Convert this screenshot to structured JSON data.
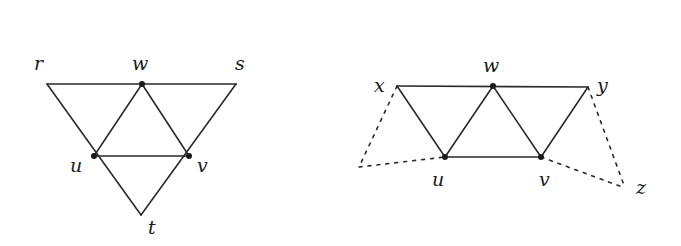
{
  "diagrams": [
    {
      "name": "left-graph",
      "vertices": [
        {
          "id": "r",
          "label": "r",
          "x": 47,
          "y": 84,
          "dot": false,
          "lx": 34,
          "ly": 70
        },
        {
          "id": "w",
          "label": "w",
          "x": 142,
          "y": 84,
          "dot": true,
          "lx": 132,
          "ly": 70
        },
        {
          "id": "s",
          "label": "s",
          "x": 236,
          "y": 84,
          "dot": false,
          "lx": 235,
          "ly": 70
        },
        {
          "id": "u",
          "label": "u",
          "x": 94,
          "y": 156,
          "dot": true,
          "lx": 70,
          "ly": 172
        },
        {
          "id": "v",
          "label": "v",
          "x": 189,
          "y": 156,
          "dot": true,
          "lx": 197,
          "ly": 172
        },
        {
          "id": "t",
          "label": "t",
          "x": 141,
          "y": 215,
          "dot": false,
          "lx": 148,
          "ly": 234
        }
      ],
      "edges": [
        [
          "r",
          "s"
        ],
        [
          "r",
          "t"
        ],
        [
          "s",
          "t"
        ],
        [
          "w",
          "u"
        ],
        [
          "w",
          "v"
        ],
        [
          "u",
          "v"
        ]
      ],
      "dashed_edges": []
    },
    {
      "name": "right-graph",
      "vertices": [
        {
          "id": "x",
          "label": "x",
          "x": 397,
          "y": 86,
          "dot": false,
          "lx": 374,
          "ly": 92
        },
        {
          "id": "w",
          "label": "w",
          "x": 493,
          "y": 86,
          "dot": true,
          "lx": 483,
          "ly": 72
        },
        {
          "id": "y",
          "label": "y",
          "x": 588,
          "y": 87,
          "dot": false,
          "lx": 597,
          "ly": 92
        },
        {
          "id": "u",
          "label": "u",
          "x": 445,
          "y": 157,
          "dot": true,
          "lx": 432,
          "ly": 186
        },
        {
          "id": "v",
          "label": "v",
          "x": 541,
          "y": 157,
          "dot": true,
          "lx": 539,
          "ly": 186
        },
        {
          "id": "p",
          "label": "",
          "x": 359,
          "y": 167,
          "dot": false,
          "lx": 0,
          "ly": 0
        },
        {
          "id": "z",
          "label": "z",
          "x": 625,
          "y": 188,
          "dot": false,
          "lx": 636,
          "ly": 194
        }
      ],
      "edges": [
        [
          "x",
          "y"
        ],
        [
          "x",
          "u"
        ],
        [
          "w",
          "u"
        ],
        [
          "w",
          "v"
        ],
        [
          "y",
          "v"
        ],
        [
          "u",
          "v"
        ]
      ],
      "dashed_edges": [
        [
          "x",
          "p"
        ],
        [
          "p",
          "u"
        ],
        [
          "y",
          "z"
        ],
        [
          "v",
          "z"
        ]
      ]
    }
  ]
}
